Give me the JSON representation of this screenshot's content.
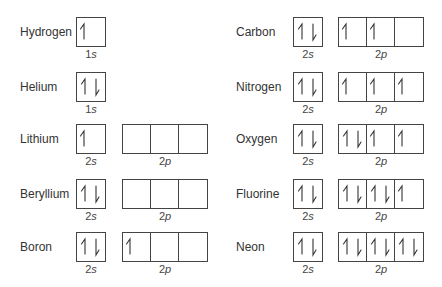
{
  "diagram": {
    "type": "orbital-box-diagrams",
    "arrow_legend": {
      "up": "spin-up electron",
      "down": "spin-down electron"
    },
    "elements": [
      {
        "name": "Hydrogen",
        "col": 0,
        "row": 0,
        "orbitals": [
          {
            "label": "1s",
            "num": "1",
            "sub": "s",
            "cells": [
              "up"
            ]
          }
        ]
      },
      {
        "name": "Helium",
        "col": 0,
        "row": 1,
        "orbitals": [
          {
            "label": "1s",
            "num": "1",
            "sub": "s",
            "cells": [
              "updown"
            ]
          }
        ]
      },
      {
        "name": "Lithium",
        "col": 0,
        "row": 2,
        "orbitals": [
          {
            "label": "2s",
            "num": "2",
            "sub": "s",
            "cells": [
              "up"
            ]
          },
          {
            "label": "2p",
            "num": "2",
            "sub": "p",
            "cells": [
              "",
              "",
              ""
            ]
          }
        ]
      },
      {
        "name": "Beryllium",
        "col": 0,
        "row": 3,
        "orbitals": [
          {
            "label": "2s",
            "num": "2",
            "sub": "s",
            "cells": [
              "updown"
            ]
          },
          {
            "label": "2p",
            "num": "2",
            "sub": "p",
            "cells": [
              "",
              "",
              ""
            ]
          }
        ]
      },
      {
        "name": "Boron",
        "col": 0,
        "row": 4,
        "orbitals": [
          {
            "label": "2s",
            "num": "2",
            "sub": "s",
            "cells": [
              "updown"
            ]
          },
          {
            "label": "2p",
            "num": "2",
            "sub": "p",
            "cells": [
              "up",
              "",
              ""
            ]
          }
        ]
      },
      {
        "name": "Carbon",
        "col": 1,
        "row": 0,
        "orbitals": [
          {
            "label": "2s",
            "num": "2",
            "sub": "s",
            "cells": [
              "updown"
            ]
          },
          {
            "label": "2p",
            "num": "2",
            "sub": "p",
            "cells": [
              "up",
              "up",
              ""
            ]
          }
        ]
      },
      {
        "name": "Nitrogen",
        "col": 1,
        "row": 1,
        "orbitals": [
          {
            "label": "2s",
            "num": "2",
            "sub": "s",
            "cells": [
              "updown"
            ]
          },
          {
            "label": "2p",
            "num": "2",
            "sub": "p",
            "cells": [
              "up",
              "up",
              "up"
            ]
          }
        ]
      },
      {
        "name": "Oxygen",
        "col": 1,
        "row": 2,
        "orbitals": [
          {
            "label": "2s",
            "num": "2",
            "sub": "s",
            "cells": [
              "updown"
            ]
          },
          {
            "label": "2p",
            "num": "2",
            "sub": "p",
            "cells": [
              "updown",
              "up",
              "up"
            ]
          }
        ]
      },
      {
        "name": "Fluorine",
        "col": 1,
        "row": 3,
        "orbitals": [
          {
            "label": "2s",
            "num": "2",
            "sub": "s",
            "cells": [
              "updown"
            ]
          },
          {
            "label": "2p",
            "num": "2",
            "sub": "p",
            "cells": [
              "updown",
              "updown",
              "up"
            ]
          }
        ]
      },
      {
        "name": "Neon",
        "col": 1,
        "row": 4,
        "orbitals": [
          {
            "label": "2s",
            "num": "2",
            "sub": "s",
            "cells": [
              "updown"
            ]
          },
          {
            "label": "2p",
            "num": "2",
            "sub": "p",
            "cells": [
              "updown",
              "updown",
              "updown"
            ]
          }
        ]
      }
    ]
  },
  "layout": {
    "rows_y": [
      17,
      72,
      124,
      179,
      232
    ],
    "columns": [
      {
        "name_x": 20,
        "s_x": 76,
        "p_x": 122
      },
      {
        "name_x": 236,
        "s_x": 293,
        "p_x": 338
      }
    ],
    "line_color": "#444444",
    "text_color": "#333333"
  }
}
